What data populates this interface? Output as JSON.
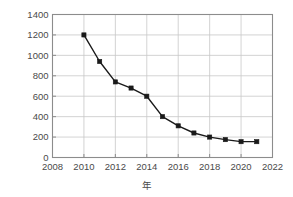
{
  "chart_data": {
    "type": "line",
    "title": "",
    "subtitle": "",
    "xlabel": "年",
    "ylabel": "コスト [$/kWh]",
    "xlim": [
      2008,
      2022
    ],
    "ylim": [
      0,
      1400
    ],
    "xticks": [
      2008,
      2010,
      2012,
      2014,
      2016,
      2018,
      2020,
      2022
    ],
    "yticks": [
      0,
      200,
      400,
      600,
      800,
      1000,
      1200,
      1400
    ],
    "grid": true,
    "legend": null,
    "marker": "filled-square",
    "line_color": "#1a1a1a",
    "marker_color": "#1a1a1a",
    "x": [
      2010,
      2011,
      2012,
      2013,
      2014,
      2015,
      2016,
      2017,
      2018,
      2019,
      2020,
      2021
    ],
    "values": [
      1200,
      940,
      740,
      680,
      600,
      400,
      310,
      240,
      200,
      175,
      155,
      155
    ],
    "series": [
      {
        "name": "コスト",
        "x": [
          2010,
          2011,
          2012,
          2013,
          2014,
          2015,
          2016,
          2017,
          2018,
          2019,
          2020,
          2021
        ],
        "values": [
          1200,
          940,
          740,
          680,
          600,
          400,
          310,
          240,
          200,
          175,
          155,
          155
        ]
      }
    ],
    "annotations": []
  },
  "axis": {
    "x_tick_labels": [
      "2008",
      "2010",
      "2012",
      "2014",
      "2016",
      "2018",
      "2020",
      "2022"
    ],
    "y_tick_labels": [
      "0",
      "200",
      "400",
      "600",
      "800",
      "1000",
      "1200",
      "1400"
    ],
    "x_title": "年",
    "y_title": "コスト [$/kWh]"
  },
  "style": {
    "background": "#ffffff",
    "grid_color": "#c8c8c8",
    "frame_color": "#8c8c8c",
    "text_color": "#4a4a4a",
    "data_color": "#1a1a1a"
  }
}
